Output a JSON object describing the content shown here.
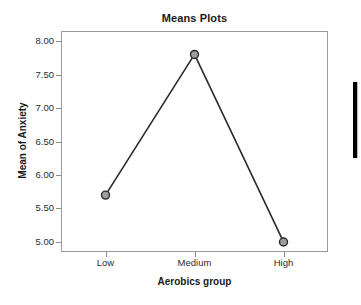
{
  "chart_data": {
    "type": "line",
    "title": "Means Plots",
    "xlabel": "Aerobics group",
    "ylabel": "Mean of Anxiety",
    "categories": [
      "Low",
      "Medium",
      "High"
    ],
    "values": [
      5.7,
      7.8,
      5.0
    ],
    "series": [
      {
        "name": "Mean of Anxiety",
        "values": [
          5.7,
          7.8,
          5.0
        ]
      }
    ],
    "ylim": [
      4.85,
      8.15
    ],
    "ytick_values": [
      8.0,
      7.5,
      7.0,
      6.5,
      6.0,
      5.5,
      5.0
    ],
    "ytick_labels": [
      "8.00",
      "7.50",
      "7.00",
      "6.50",
      "6.00",
      "5.50",
      "5.00"
    ],
    "xtick_labels": [
      "Low",
      "Medium",
      "High"
    ],
    "grid": false,
    "legend": null,
    "marker": "circle",
    "marker_fill": "#9e9e9e",
    "marker_edge": "#2b2b2b",
    "line_color": "#2b2b2b",
    "frame_color": "#9a9a9a",
    "background": "#ffffff"
  },
  "figure": {
    "title": "Means Plots",
    "x_axis_title": "Aerobics group",
    "y_axis_title": "Mean of Anxiety"
  },
  "artifacts": {
    "edge_bar_name": "right-edge-bar"
  }
}
